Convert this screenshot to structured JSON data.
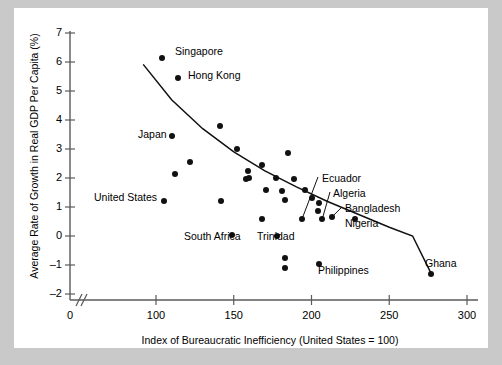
{
  "chart_data": {
    "type": "scatter",
    "title": "",
    "xlabel": "Index of Bureaucratic Inefficiency (United States = 100)",
    "ylabel": "Average Rate of Growth in Real GDP Per Capita (%)",
    "xlim": [
      0,
      300
    ],
    "ylim": [
      -2,
      7
    ],
    "xticks": [
      0,
      100,
      150,
      200,
      250,
      300
    ],
    "xtick_labels": [
      "0",
      "100",
      "150",
      "200",
      "250",
      "300"
    ],
    "yticks": [
      -2,
      -1,
      0,
      1,
      2,
      3,
      4,
      5,
      6,
      7
    ],
    "ytick_labels": [
      "–2",
      "–1",
      "0",
      "1",
      "2",
      "3",
      "4",
      "5",
      "6",
      "7"
    ],
    "axis_break": true,
    "grid": false,
    "legend": "none",
    "marker": "filled-circle",
    "trend_line": {
      "description": "downward-sloping convex curve",
      "points": [
        [
          92,
          5.9
        ],
        [
          110,
          4.7
        ],
        [
          130,
          3.7
        ],
        [
          150,
          2.9
        ],
        [
          170,
          2.25
        ],
        [
          190,
          1.7
        ],
        [
          210,
          1.2
        ],
        [
          230,
          0.75
        ],
        [
          250,
          0.3
        ],
        [
          265,
          0.0
        ],
        [
          277,
          -1.3
        ]
      ]
    },
    "points": [
      {
        "x": 104,
        "y": 6.15,
        "label": "Singapore",
        "label_side": "right"
      },
      {
        "x": 114,
        "y": 5.45,
        "label": "Hong Kong",
        "label_side": "right"
      },
      {
        "x": 141,
        "y": 3.8,
        "label": ""
      },
      {
        "x": 110,
        "y": 3.45,
        "label": "Japan",
        "label_side": "left"
      },
      {
        "x": 152,
        "y": 3.0,
        "label": ""
      },
      {
        "x": 122,
        "y": 2.55,
        "label": ""
      },
      {
        "x": 168,
        "y": 2.45,
        "label": ""
      },
      {
        "x": 112,
        "y": 2.15,
        "label": ""
      },
      {
        "x": 159,
        "y": 2.25,
        "label": ""
      },
      {
        "x": 160,
        "y": 2.0,
        "label": ""
      },
      {
        "x": 158,
        "y": 1.95,
        "label": ""
      },
      {
        "x": 177,
        "y": 2.0,
        "label": ""
      },
      {
        "x": 189,
        "y": 1.95,
        "label": ""
      },
      {
        "x": 185,
        "y": 2.85,
        "label": ""
      },
      {
        "x": 105,
        "y": 1.2,
        "label": "United States",
        "label_side": "left"
      },
      {
        "x": 142,
        "y": 1.2,
        "label": ""
      },
      {
        "x": 171,
        "y": 1.6,
        "label": ""
      },
      {
        "x": 181,
        "y": 1.55,
        "label": ""
      },
      {
        "x": 196,
        "y": 1.6,
        "label": ""
      },
      {
        "x": 183,
        "y": 1.25,
        "label": ""
      },
      {
        "x": 200,
        "y": 1.3,
        "label": ""
      },
      {
        "x": 205,
        "y": 1.15,
        "label": ""
      },
      {
        "x": 204,
        "y": 0.85,
        "label": ""
      },
      {
        "x": 168,
        "y": 0.6,
        "label": ""
      },
      {
        "x": 149,
        "y": 0.05,
        "label": "South Africa",
        "label_side": "left"
      },
      {
        "x": 178,
        "y": 0.0,
        "label": "Trinidad",
        "label_side": "right"
      },
      {
        "x": 194,
        "y": 0.6,
        "label": "Ecuador",
        "leader": true
      },
      {
        "x": 207,
        "y": 0.6,
        "label": "Algeria",
        "leader": true
      },
      {
        "x": 213,
        "y": 0.65,
        "label": "Bangladesh",
        "leader": true
      },
      {
        "x": 228,
        "y": 0.6,
        "label": "Nigeria",
        "label_side": "right"
      },
      {
        "x": 183,
        "y": -0.75,
        "label": ""
      },
      {
        "x": 183,
        "y": -1.1,
        "label": ""
      },
      {
        "x": 205,
        "y": -0.95,
        "label": "Philippines",
        "label_side": "right"
      },
      {
        "x": 277,
        "y": -1.3,
        "label": "Ghana",
        "label_side": "above-right"
      }
    ],
    "labels": [
      {
        "text": "Singapore",
        "x": 175,
        "y": 46
      },
      {
        "text": "Hong Kong",
        "x": 188,
        "y": 70
      },
      {
        "text": "Japan",
        "x": 138,
        "y": 129
      },
      {
        "text": "United States",
        "x": 94,
        "y": 192
      },
      {
        "text": "South Africa",
        "x": 184,
        "y": 231
      },
      {
        "text": "Trinidad",
        "x": 257,
        "y": 231
      },
      {
        "text": "Ecuador",
        "x": 322,
        "y": 173
      },
      {
        "text": "Algeria",
        "x": 333,
        "y": 188
      },
      {
        "text": "Bangladesh",
        "x": 345,
        "y": 203
      },
      {
        "text": "Nigeria",
        "x": 345,
        "y": 218
      },
      {
        "text": "Philippines",
        "x": 318,
        "y": 265
      },
      {
        "text": "Ghana",
        "x": 425,
        "y": 258
      }
    ],
    "colors": {
      "marker": "#111111",
      "axis": "#5a5a5a",
      "text": "#000000",
      "plot_background": "#ffffff",
      "page_background": "#c9c9c9"
    }
  }
}
